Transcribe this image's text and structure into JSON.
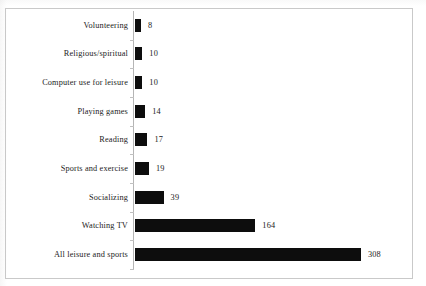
{
  "chart_data": {
    "type": "bar",
    "orientation": "horizontal",
    "title": "",
    "subtitle": "",
    "xlabel": "",
    "ylabel": "",
    "grid": false,
    "legend": false,
    "axis_line": true,
    "value_labels": true,
    "xlim": [
      0,
      308
    ],
    "categories": [
      "Volunteering",
      "Religious/spiritual",
      "Computer use for leisure",
      "Playing games",
      "Reading",
      "Sports and exercise",
      "Socializing",
      "Watching TV",
      "All leisure and sports"
    ],
    "values": [
      8,
      10,
      10,
      14,
      17,
      19,
      39,
      164,
      308
    ],
    "value_labels_text": [
      "8",
      "10",
      "10",
      "14",
      "17",
      "19",
      "39",
      "164",
      "308"
    ],
    "bar_color": "#0d0d0d",
    "background_color": "#ffffff",
    "frame_color": "#c9c9c9"
  },
  "rows": [
    {
      "label": "Volunteering",
      "value": 8,
      "value_text": "8"
    },
    {
      "label": "Religious/spiritual",
      "value": 10,
      "value_text": "10"
    },
    {
      "label": "Computer use for leisure",
      "value": 10,
      "value_text": "10"
    },
    {
      "label": "Playing games",
      "value": 14,
      "value_text": "14"
    },
    {
      "label": "Reading",
      "value": 17,
      "value_text": "17"
    },
    {
      "label": "Sports and exercise",
      "value": 19,
      "value_text": "19"
    },
    {
      "label": "Socializing",
      "value": 39,
      "value_text": "39"
    },
    {
      "label": "Watching TV",
      "value": 164,
      "value_text": "164"
    },
    {
      "label": "All leisure and sports",
      "value": 308,
      "value_text": "308"
    }
  ]
}
